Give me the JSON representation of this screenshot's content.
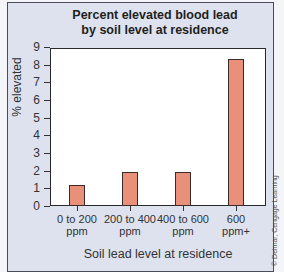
{
  "chart_data": {
    "type": "bar",
    "title": "Percent elevated blood lead by soil level at residence",
    "title_lines": [
      "Percent elevated blood lead",
      "by soil level at residence"
    ],
    "categories": [
      "0 to 200 ppm",
      "200 to 400 ppm",
      "400 to 600 ppm",
      "600 ppm+"
    ],
    "category_lines": [
      [
        "0 to 200",
        "ppm"
      ],
      [
        "200 to 400",
        "ppm"
      ],
      [
        "400 to 600",
        "ppm"
      ],
      [
        "600",
        "ppm+"
      ]
    ],
    "values": [
      1.2,
      1.9,
      1.9,
      8.3
    ],
    "xlabel": "Soil lead level at residence",
    "ylabel": "% elevated",
    "ylim": [
      0,
      9
    ],
    "yticks": [
      0,
      1,
      2,
      3,
      4,
      5,
      6,
      7,
      8,
      9
    ],
    "grid": false,
    "legend": null,
    "bar_color": "#e8907a"
  },
  "credit": "© Delmar, Cengage Learning"
}
